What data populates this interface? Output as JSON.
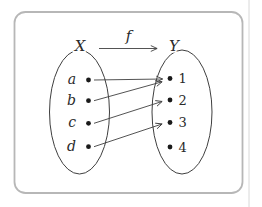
{
  "figure": {
    "function_label": "f",
    "domain_set": {
      "label": "X",
      "elements": [
        "a",
        "b",
        "c",
        "d"
      ]
    },
    "codomain_set": {
      "label": "Y",
      "elements": [
        "1",
        "2",
        "3",
        "4"
      ]
    },
    "mappings": [
      {
        "from": "a",
        "to": "1"
      },
      {
        "from": "b",
        "to": "1"
      },
      {
        "from": "c",
        "to": "2"
      },
      {
        "from": "d",
        "to": "3"
      }
    ],
    "colors": {
      "line": "#3f3f3f",
      "dot": "#1a1a1a",
      "box_border": "#b7b7b7",
      "page_divider": "#d8d8d8",
      "background": "#ffffff"
    }
  }
}
